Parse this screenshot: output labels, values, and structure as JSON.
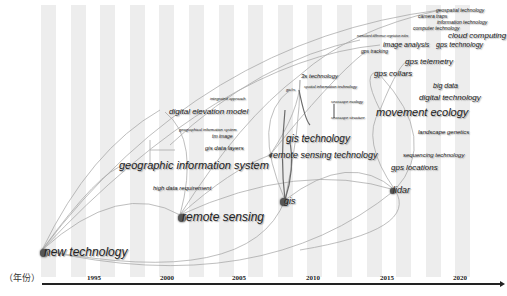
{
  "axis": {
    "label": "（年份）",
    "ticks": [
      {
        "label": "1995",
        "x": 87
      },
      {
        "label": "2000",
        "x": 160
      },
      {
        "label": "2005",
        "x": 232
      },
      {
        "label": "2010",
        "x": 306
      },
      {
        "label": "2015",
        "x": 380
      },
      {
        "label": "2020",
        "x": 453
      }
    ]
  },
  "colors": {
    "stripe": "#ededed",
    "edge": "#9a9a9a",
    "node": "#555555",
    "text": "#222222"
  },
  "keywords": [
    {
      "id": "k0",
      "label": "new technology",
      "x": 44,
      "y": 246,
      "size": 12,
      "node": 8
    },
    {
      "id": "k1",
      "label": "remote sensing",
      "x": 182,
      "y": 211,
      "size": 12,
      "node": 8
    },
    {
      "id": "k2",
      "label": "geographic information system",
      "x": 119,
      "y": 160,
      "size": 11,
      "node": 0
    },
    {
      "id": "k3",
      "label": "high data requirement",
      "x": 153,
      "y": 185,
      "size": 6,
      "node": 0
    },
    {
      "id": "k4",
      "label": "digital elevation model",
      "x": 169,
      "y": 108,
      "size": 8,
      "node": 0
    },
    {
      "id": "k5",
      "label": "integrated approach",
      "x": 210,
      "y": 97,
      "size": 4,
      "node": 0
    },
    {
      "id": "k6",
      "label": "geographical information system",
      "x": 179,
      "y": 128,
      "size": 4,
      "node": 0
    },
    {
      "id": "k7",
      "label": "tm image",
      "x": 212,
      "y": 134,
      "size": 5,
      "node": 0
    },
    {
      "id": "k8",
      "label": "gis data layers",
      "x": 205,
      "y": 145,
      "size": 6,
      "node": 0
    },
    {
      "id": "k9",
      "label": "remote sensing technology",
      "x": 270,
      "y": 151,
      "size": 9,
      "node": 3
    },
    {
      "id": "k10",
      "label": "gis technology",
      "x": 286,
      "y": 134,
      "size": 10,
      "node": 0
    },
    {
      "id": "k11",
      "label": "gis",
      "x": 284,
      "y": 197,
      "size": 9,
      "node": 8
    },
    {
      "id": "k12",
      "label": "3s technology",
      "x": 301,
      "y": 73,
      "size": 6,
      "node": 0
    },
    {
      "id": "k13",
      "label": "spatial information technology",
      "x": 304,
      "y": 85,
      "size": 4,
      "node": 0
    },
    {
      "id": "k14",
      "label": "seascape ecology",
      "x": 331,
      "y": 100,
      "size": 4,
      "node": 0
    },
    {
      "id": "k15",
      "label": "seascape structure",
      "x": 331,
      "y": 116,
      "size": 4,
      "node": 0
    },
    {
      "id": "k16",
      "label": "gis/rs",
      "x": 286,
      "y": 88,
      "size": 4,
      "node": 0
    },
    {
      "id": "k17",
      "label": "lidar",
      "x": 393,
      "y": 186,
      "size": 9,
      "node": 6
    },
    {
      "id": "k18",
      "label": "gps locations",
      "x": 391,
      "y": 164,
      "size": 8,
      "node": 0
    },
    {
      "id": "k19",
      "label": "sequencing technology",
      "x": 403,
      "y": 152,
      "size": 6,
      "node": 0
    },
    {
      "id": "k20",
      "label": "landscape genetics",
      "x": 418,
      "y": 129,
      "size": 6,
      "node": 0
    },
    {
      "id": "k21",
      "label": "movement ecology",
      "x": 376,
      "y": 107,
      "size": 11,
      "node": 0
    },
    {
      "id": "k22",
      "label": "digital technology",
      "x": 419,
      "y": 94,
      "size": 8,
      "node": 0
    },
    {
      "id": "k23",
      "label": "big data",
      "x": 433,
      "y": 82,
      "size": 7,
      "node": 0
    },
    {
      "id": "k24",
      "label": "gps telemetry",
      "x": 405,
      "y": 58,
      "size": 8,
      "node": 0
    },
    {
      "id": "k25",
      "label": "gps collars",
      "x": 374,
      "y": 70,
      "size": 8,
      "node": 0
    },
    {
      "id": "k26",
      "label": "gps technology",
      "x": 436,
      "y": 41,
      "size": 7,
      "node": 0
    },
    {
      "id": "k27",
      "label": "cloud computing",
      "x": 448,
      "y": 32,
      "size": 8,
      "node": 0
    },
    {
      "id": "k28",
      "label": "computer technology",
      "x": 413,
      "y": 26,
      "size": 5,
      "node": 0
    },
    {
      "id": "k29",
      "label": "information technology",
      "x": 437,
      "y": 20,
      "size": 5,
      "node": 0
    },
    {
      "id": "k30",
      "label": "camera traps",
      "x": 418,
      "y": 14,
      "size": 5,
      "node": 0
    },
    {
      "id": "k31",
      "label": "geospatial technology",
      "x": 436,
      "y": 8,
      "size": 5,
      "node": 0
    },
    {
      "id": "k32",
      "label": "image analysis",
      "x": 383,
      "y": 41,
      "size": 7,
      "node": 0
    },
    {
      "id": "k33",
      "label": "normalized difference vegetation index",
      "x": 357,
      "y": 35,
      "size": 3,
      "node": 0
    },
    {
      "id": "k34",
      "label": "gps tracking",
      "x": 361,
      "y": 49,
      "size": 5,
      "node": 0
    }
  ]
}
